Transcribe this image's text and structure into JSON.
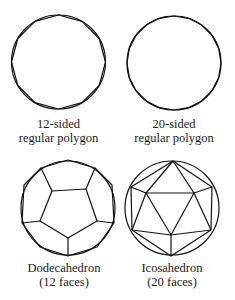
{
  "figures": [
    {
      "id": "polygon-12",
      "caption_line1": "12-sided",
      "caption_line2": "regular polygon",
      "sides": 12
    },
    {
      "id": "polygon-20",
      "caption_line1": "20-sided",
      "caption_line2": "regular polygon",
      "sides": 20
    },
    {
      "id": "dodecahedron",
      "caption_line1": "Dodecahedron",
      "caption_line2": "(12 faces)",
      "faces": 12
    },
    {
      "id": "icosahedron",
      "caption_line1": "Icosahedron",
      "caption_line2": "(20 faces)",
      "faces": 20
    }
  ],
  "colors": {
    "line": "#111111",
    "background": "#ffffff",
    "text": "#1a1a1a"
  }
}
